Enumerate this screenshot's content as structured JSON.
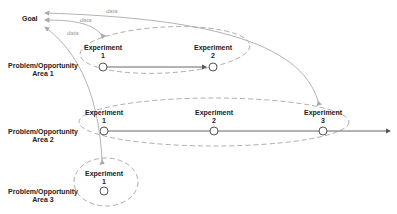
{
  "goal": {
    "label": "Goal"
  },
  "data_labels": [
    "data",
    "data",
    "data"
  ],
  "areas": [
    {
      "line1": "Problem/Opportunity",
      "line2": "Area 1",
      "experiments": [
        {
          "title": "Experiment",
          "num": "1"
        },
        {
          "title": "Experiment",
          "num": "2"
        }
      ]
    },
    {
      "line1": "Problem/Opportunity",
      "line2": "Area 2",
      "experiments": [
        {
          "title": "Experiment",
          "num": "1"
        },
        {
          "title": "Experiment",
          "num": "2"
        },
        {
          "title": "Experiment",
          "num": "3"
        }
      ]
    },
    {
      "line1": "Problem/Opportunity",
      "line2": "Area 3",
      "experiments": [
        {
          "title": "Experiment",
          "num": "1"
        }
      ]
    }
  ],
  "colors": {
    "line": "#555555",
    "feedback": "#aaaaaa",
    "dash": "#999999"
  }
}
